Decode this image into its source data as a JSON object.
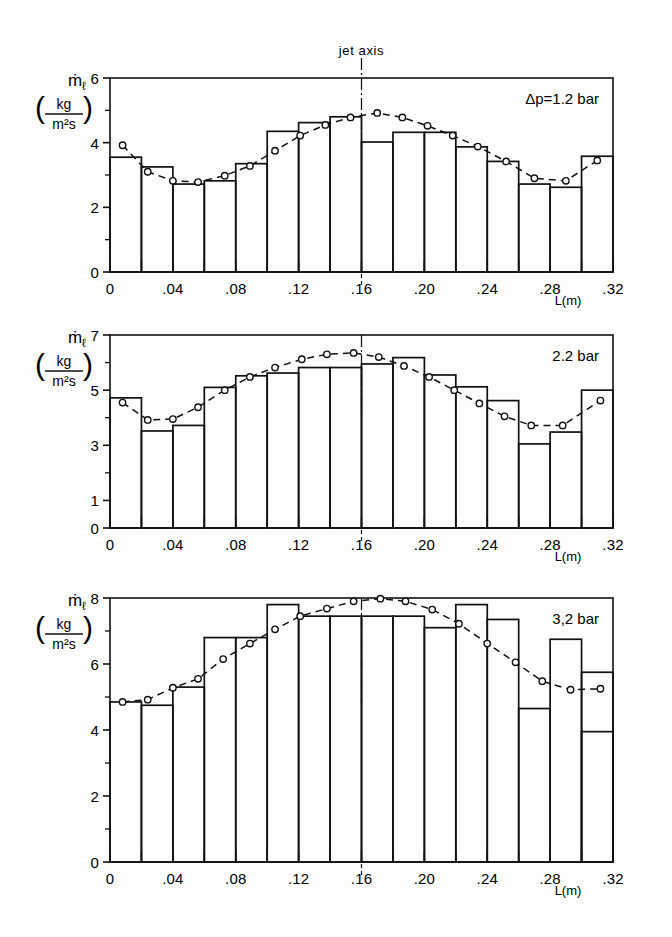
{
  "figure": {
    "jet_axis_label": "jet axis",
    "jet_axis_position": 0.16,
    "x_axis_label": "L(m)",
    "y_axis_symbol": "ṁ",
    "y_axis_subscript": "ℓ",
    "y_unit_numerator": "kg",
    "y_unit_denominator": "m²s",
    "bar_width": 0.02,
    "line_color": "#000000",
    "bar_color": "#000000",
    "background": "#fdfdfc"
  },
  "x_tick_labels": [
    "0",
    ".04",
    ".08",
    ".12",
    ".16",
    ".20",
    ".24",
    ".28",
    ".32"
  ],
  "x_tick_values": [
    0,
    0.04,
    0.08,
    0.12,
    0.16,
    0.2,
    0.24,
    0.28,
    0.32
  ],
  "chart_data": [
    {
      "type": "bar",
      "panel": 1,
      "title": "",
      "annotation": "Δp=1.2 bar",
      "xlabel": "L(m)",
      "ylabel": "ṁℓ (kg/m²s)",
      "xlim": [
        0,
        0.32
      ],
      "ylim": [
        0,
        6
      ],
      "ytick_labels": [
        "0",
        "2",
        "4",
        "6"
      ],
      "ytick_values": [
        0,
        2,
        4,
        6
      ],
      "yminor_values": [
        1,
        3,
        5
      ],
      "grid": false,
      "legend": "none",
      "categories": [
        0.01,
        0.03,
        0.05,
        0.07,
        0.09,
        0.11,
        0.13,
        0.15,
        0.17,
        0.19,
        0.21,
        0.23,
        0.25,
        0.27,
        0.29,
        0.31
      ],
      "values": [
        3.55,
        3.25,
        2.72,
        2.82,
        3.35,
        4.35,
        4.62,
        4.8,
        4.02,
        4.32,
        4.32,
        3.87,
        3.42,
        2.72,
        2.62,
        3.58
      ],
      "series": [
        {
          "name": "measured histogram",
          "type": "bar",
          "values": [
            3.55,
            3.25,
            2.72,
            2.82,
            3.35,
            4.35,
            4.62,
            4.8,
            4.02,
            4.32,
            4.32,
            3.87,
            3.42,
            2.72,
            2.62,
            3.58
          ]
        },
        {
          "name": "fitted curve",
          "type": "line-dashed-markers",
          "x": [
            0.008,
            0.024,
            0.04,
            0.056,
            0.073,
            0.089,
            0.105,
            0.121,
            0.137,
            0.153,
            0.17,
            0.186,
            0.202,
            0.218,
            0.234,
            0.252,
            0.27,
            0.29,
            0.31
          ],
          "values": [
            3.92,
            3.1,
            2.82,
            2.78,
            2.98,
            3.28,
            3.75,
            4.22,
            4.55,
            4.78,
            4.92,
            4.78,
            4.52,
            4.22,
            3.88,
            3.42,
            2.9,
            2.82,
            3.45
          ]
        }
      ]
    },
    {
      "type": "bar",
      "panel": 2,
      "title": "",
      "annotation": "2.2 bar",
      "xlabel": "L(m)",
      "ylabel": "ṁℓ (kg/m²s)",
      "xlim": [
        0,
        0.32
      ],
      "ylim": [
        0,
        7
      ],
      "ytick_labels": [
        "0",
        "1",
        "3",
        "5",
        "7"
      ],
      "ytick_values": [
        0,
        1,
        3,
        5,
        7
      ],
      "yminor_values": [
        2,
        4,
        6
      ],
      "grid": false,
      "legend": "none",
      "categories": [
        0.01,
        0.03,
        0.05,
        0.07,
        0.09,
        0.11,
        0.13,
        0.15,
        0.17,
        0.19,
        0.21,
        0.23,
        0.25,
        0.27,
        0.29,
        0.31
      ],
      "values": [
        4.72,
        3.52,
        3.72,
        5.1,
        5.52,
        5.62,
        5.82,
        5.82,
        5.95,
        6.18,
        5.55,
        5.12,
        4.62,
        3.05,
        3.48,
        5.0
      ],
      "series": [
        {
          "name": "measured histogram",
          "type": "bar",
          "values": [
            4.72,
            3.52,
            3.72,
            5.1,
            5.52,
            5.62,
            5.82,
            5.82,
            5.95,
            6.18,
            5.55,
            5.12,
            4.62,
            3.05,
            3.48,
            5.0
          ]
        },
        {
          "name": "fitted curve",
          "type": "line-dashed-markers",
          "x": [
            0.008,
            0.024,
            0.04,
            0.056,
            0.073,
            0.089,
            0.105,
            0.122,
            0.138,
            0.155,
            0.171,
            0.187,
            0.203,
            0.219,
            0.235,
            0.251,
            0.268,
            0.288,
            0.312
          ],
          "values": [
            4.55,
            3.92,
            3.95,
            4.38,
            5.0,
            5.48,
            5.82,
            6.12,
            6.3,
            6.35,
            6.2,
            5.88,
            5.48,
            5.0,
            4.52,
            4.05,
            3.72,
            3.72,
            4.62
          ]
        }
      ]
    },
    {
      "type": "bar",
      "panel": 3,
      "title": "",
      "annotation": "3,2 bar",
      "xlabel": "L(m)",
      "ylabel": "ṁℓ (kg/m²s)",
      "xlim": [
        0,
        0.32
      ],
      "ylim": [
        0,
        8
      ],
      "ytick_labels": [
        "0",
        "2",
        "4",
        "6",
        "8"
      ],
      "ytick_values": [
        0,
        2,
        4,
        6,
        8
      ],
      "yminor_values": [
        1,
        3,
        5,
        7
      ],
      "grid": false,
      "legend": "none",
      "categories": [
        0.01,
        0.03,
        0.05,
        0.07,
        0.09,
        0.11,
        0.13,
        0.15,
        0.17,
        0.19,
        0.21,
        0.23,
        0.25,
        0.27,
        0.29,
        0.31
      ],
      "values": [
        4.85,
        4.75,
        5.3,
        6.8,
        6.8,
        7.8,
        7.45,
        7.45,
        7.45,
        7.45,
        7.1,
        7.8,
        7.35,
        4.65,
        6.75,
        3.95
      ],
      "series": [
        {
          "name": "measured histogram",
          "type": "bar",
          "values": [
            4.85,
            4.75,
            5.3,
            6.8,
            6.8,
            7.8,
            7.45,
            7.45,
            7.45,
            7.45,
            7.1,
            7.8,
            7.35,
            4.65,
            6.75,
            3.95
          ],
          "note_last_partial": 5.75
        },
        {
          "name": "fitted curve",
          "type": "line-dashed-markers",
          "x": [
            0.008,
            0.024,
            0.04,
            0.056,
            0.072,
            0.089,
            0.105,
            0.121,
            0.138,
            0.155,
            0.172,
            0.188,
            0.205,
            0.222,
            0.24,
            0.258,
            0.275,
            0.293,
            0.312
          ],
          "values": [
            4.85,
            4.92,
            5.28,
            5.55,
            6.15,
            6.62,
            7.05,
            7.45,
            7.68,
            7.9,
            7.98,
            7.9,
            7.65,
            7.22,
            6.62,
            6.05,
            5.48,
            5.22,
            5.25
          ]
        }
      ]
    }
  ]
}
